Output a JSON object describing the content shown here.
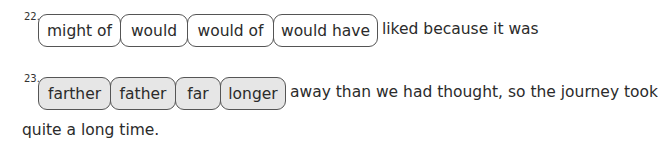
{
  "questions": [
    {
      "number": "22.",
      "options": [
        "might of",
        "would",
        "would of",
        "would have"
      ],
      "after_text": "liked because it was"
    },
    {
      "number": "23.",
      "options": [
        "farther",
        "father",
        "far",
        "longer"
      ],
      "after_text": "away than we had thought, so the journey took",
      "continuation": "quite a long time."
    }
  ]
}
